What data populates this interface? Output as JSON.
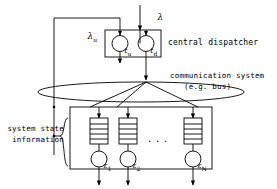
{
  "figure": {
    "type": "system-architecture-diagram",
    "stroke_color": "#000000",
    "background": "#ffffff"
  },
  "labels": {
    "lambda_arrival": "λ",
    "lambda_update": "λ",
    "lambda_update_sub": "u",
    "dispatcher": "central dispatcher",
    "communication_line1": "communication system",
    "communication_line2": "(e.g. bus)",
    "system_state_line1": "system state",
    "system_state_line2": "information",
    "ellipsis": "..."
  },
  "dispatcher": {
    "nodes": [
      {
        "symbol": "t",
        "subscript": "u",
        "name": "update-timer"
      },
      {
        "symbol": "t",
        "subscript": "d",
        "name": "dispatch-timer"
      }
    ]
  },
  "servers": {
    "nodes": [
      {
        "symbol": "ε",
        "subscript": "1"
      },
      {
        "symbol": "ε",
        "subscript": "2"
      },
      {
        "symbol": "ε",
        "subscript": "N"
      }
    ],
    "queue_slots": 4
  }
}
